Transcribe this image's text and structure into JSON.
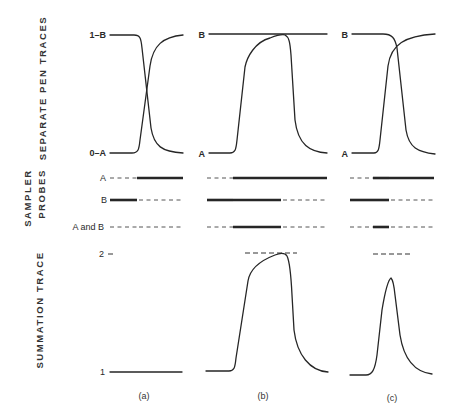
{
  "figure": {
    "row_labels": {
      "separate_pen_traces": "SEPARATE PEN TRACES",
      "sampler": "SAMPLER",
      "probes": "PROBES",
      "summation_trace": "SUMMATION TRACE"
    },
    "panels": [
      {
        "id": "a",
        "label": "(a)"
      },
      {
        "id": "b",
        "label": "(b)"
      },
      {
        "id": "c",
        "label": "(c)"
      }
    ],
    "trace_labels": {
      "a": {
        "top": "1–B",
        "bottom": "0–A"
      },
      "b": {
        "top": "B",
        "bottom": "A"
      },
      "c": {
        "top": "B",
        "bottom": "A"
      }
    },
    "probe_labels": [
      "A",
      "B",
      "A and B"
    ],
    "summation_ticks": {
      "top": "2",
      "bottom": "1"
    },
    "probe_states": {
      "a": {
        "A": [
          "off",
          "on"
        ],
        "B": [
          "on",
          "off"
        ],
        "A and B": [
          "off",
          "off"
        ]
      },
      "b": {
        "A": [
          "off",
          "on",
          "on"
        ],
        "B": [
          "on",
          "on",
          "off"
        ],
        "A and B": [
          "off",
          "on",
          "off"
        ]
      },
      "c": {
        "A": [
          "off",
          "on",
          "on"
        ],
        "B": [
          "on",
          "on",
          "off"
        ],
        "A and B": [
          "off",
          "on",
          "off"
        ]
      }
    }
  }
}
